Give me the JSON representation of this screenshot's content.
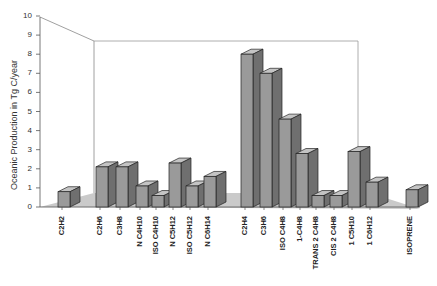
{
  "chart_data": {
    "type": "bar",
    "style": "3d-grouped-bar",
    "title": "",
    "xlabel": "",
    "ylabel": "Oceanic Production in Tg C/year",
    "ylim": [
      0,
      10
    ],
    "yticks": [
      "0",
      "1",
      "2",
      "3",
      "4",
      "5",
      "6",
      "7",
      "8",
      "9",
      "10"
    ],
    "categories": [
      "C2H2",
      "C2H6",
      "C3H8",
      "N C4H10",
      "ISO C4H10",
      "N C5H12",
      "ISO C5H12",
      "N C6H14",
      "C2H4",
      "C3H6",
      "ISO C4H8",
      "1-C4H8",
      "TRANS 2 C4H8",
      "CIS 2 C4H8",
      "1 C5H10",
      "1 C6H12",
      "ISOPRENE"
    ],
    "values": [
      0.8,
      2.1,
      2.1,
      1.1,
      0.6,
      2.3,
      1.1,
      1.6,
      8.0,
      7.0,
      4.6,
      2.8,
      0.6,
      0.6,
      2.9,
      1.3,
      0.9
    ],
    "grid": false,
    "legend": null
  },
  "colors": {
    "bar": "#9a9a9a",
    "bar_side": "#6f6f6f",
    "bar_top": "#c4c4c4",
    "floor": "#bdbdbd",
    "axis": "#555555"
  }
}
